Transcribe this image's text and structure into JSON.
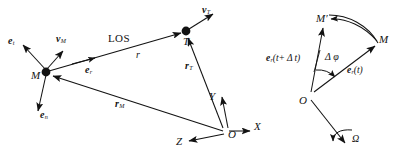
{
  "figure": {
    "background_color": "#ffffff",
    "ink_color": "#121212",
    "width": 400,
    "height": 163
  },
  "left_diagram": {
    "name": "missile-target-engagement-geometry",
    "points": [
      {
        "id": "M",
        "label": "M",
        "x": 46,
        "y": 72,
        "marker": "filled-dot"
      },
      {
        "id": "T",
        "label": "T",
        "x": 186,
        "y": 31,
        "marker": "filled-dot"
      },
      {
        "id": "O",
        "label": "O",
        "x": 226,
        "y": 133,
        "marker": "none"
      }
    ],
    "vectors": [
      {
        "id": "e_t",
        "base": "e",
        "subscript": "t",
        "label_x": 8,
        "label_y": 41
      },
      {
        "id": "v_M",
        "base": "v",
        "subscript": "M",
        "label_x": 56,
        "label_y": 39
      },
      {
        "id": "e_n",
        "base": "e",
        "subscript": "n",
        "label_x": 40,
        "label_y": 115
      },
      {
        "id": "e_r",
        "base": "e",
        "subscript": "r",
        "label_x": 85,
        "label_y": 70
      },
      {
        "id": "r_T",
        "base": "r",
        "subscript": "T",
        "label_x": 185,
        "label_y": 66
      },
      {
        "id": "r_M",
        "base": "r",
        "subscript": "M",
        "label_x": 115,
        "label_y": 104
      },
      {
        "id": "v_T",
        "base": "v",
        "subscript": "T",
        "label_x": 202,
        "label_y": 9
      }
    ],
    "line_of_sight_label": "LOS",
    "line_of_sight_label_x": 108,
    "line_of_sight_label_y": 38,
    "range_label": "r",
    "range_label_x": 136,
    "range_label_y": 54,
    "axes": [
      {
        "id": "X",
        "label": "X",
        "label_x": 254,
        "label_y": 125
      },
      {
        "id": "Y",
        "label": "Y",
        "label_x": 209,
        "label_y": 95
      },
      {
        "id": "Z",
        "label": "Z",
        "label_x": 176,
        "label_y": 140
      }
    ]
  },
  "right_diagram": {
    "name": "line-of-sight-rotation-geometry",
    "points": [
      {
        "id": "Mprime",
        "label": "M′",
        "x": 324,
        "y": 19,
        "marker": "none"
      },
      {
        "id": "M",
        "label": "M",
        "x": 378,
        "y": 40,
        "marker": "none"
      },
      {
        "id": "O",
        "label": "O",
        "x": 309,
        "y": 97,
        "marker": "none"
      }
    ],
    "labels": [
      {
        "id": "e_r_t_plus_dt",
        "text": "e",
        "subscript": "r",
        "suffix": "(t+ Δ t)",
        "x": 268,
        "y": 58
      },
      {
        "id": "delta_phi",
        "text": "Δ φ",
        "x": 325,
        "y": 57
      },
      {
        "id": "e_r_t",
        "text": "e",
        "subscript": "r",
        "suffix": "(t)",
        "x": 347,
        "y": 70
      },
      {
        "id": "omega",
        "text": "Ω",
        "x": 352,
        "y": 139
      }
    ]
  }
}
